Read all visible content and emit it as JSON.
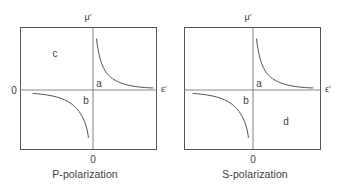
{
  "figure": {
    "panels": [
      {
        "id": "p-polarization",
        "caption": "P-polarization",
        "axes": {
          "y_axis_label": "μ′",
          "x_axis_label": "ε′",
          "y_origin_label": "0",
          "x_origin_label": "0"
        },
        "regions": [
          {
            "key": "a",
            "label": "a",
            "quadrant": "upper-right"
          },
          {
            "key": "b",
            "label": "b",
            "quadrant": "lower-left-of-axis"
          },
          {
            "key": "c",
            "label": "c",
            "quadrant": "upper-left"
          }
        ],
        "curves": [
          {
            "key": "upper-right-hyperbola",
            "quadrant": "upper-right"
          },
          {
            "key": "lower-left-hyperbola",
            "quadrant": "lower-left"
          }
        ]
      },
      {
        "id": "s-polarization",
        "caption": "S-polarization",
        "axes": {
          "y_axis_label": "μ′",
          "x_axis_label": "ε′",
          "y_origin_label": "",
          "x_origin_label": "0"
        },
        "regions": [
          {
            "key": "a",
            "label": "a",
            "quadrant": "upper-right"
          },
          {
            "key": "b",
            "label": "b",
            "quadrant": "lower-left-of-axis"
          },
          {
            "key": "d",
            "label": "d",
            "quadrant": "lower-right"
          }
        ],
        "curves": [
          {
            "key": "upper-right-hyperbola",
            "quadrant": "upper-right"
          },
          {
            "key": "lower-left-hyperbola",
            "quadrant": "lower-left"
          }
        ]
      }
    ],
    "colors": {
      "background": "#ffffff",
      "frame": "#555555",
      "axis": "#8a8a8a",
      "curve": "#555555",
      "text": "#3d3d3d"
    }
  }
}
